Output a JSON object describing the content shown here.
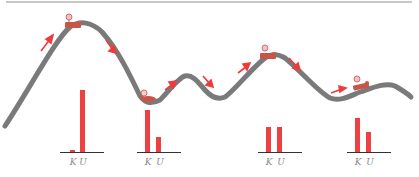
{
  "colors": {
    "track": "#7a7a7a",
    "cart": "#c9544a",
    "arrow": "#ee3b3b",
    "bar": "#ee4040",
    "axis": "#333333",
    "label": "#888888"
  },
  "charts": [
    {
      "id": "chart-1",
      "position": "top of first hill",
      "labels": [
        "K",
        "U"
      ],
      "values": [
        2,
        62
      ]
    },
    {
      "id": "chart-2",
      "position": "first valley",
      "labels": [
        "K",
        "U"
      ],
      "values": [
        42,
        15
      ]
    },
    {
      "id": "chart-3",
      "position": "third hill top",
      "labels": [
        "K",
        "U"
      ],
      "values": [
        25,
        25
      ]
    },
    {
      "id": "chart-4",
      "position": "final gentle hill",
      "labels": [
        "K",
        "U"
      ],
      "values": [
        34,
        20
      ]
    }
  ],
  "chart_labels": {
    "c1k": "K",
    "c1u": "U",
    "c2k": "K",
    "c2u": "U",
    "c3k": "K",
    "c3u": "U",
    "c4k": "K",
    "c4u": "U"
  }
}
